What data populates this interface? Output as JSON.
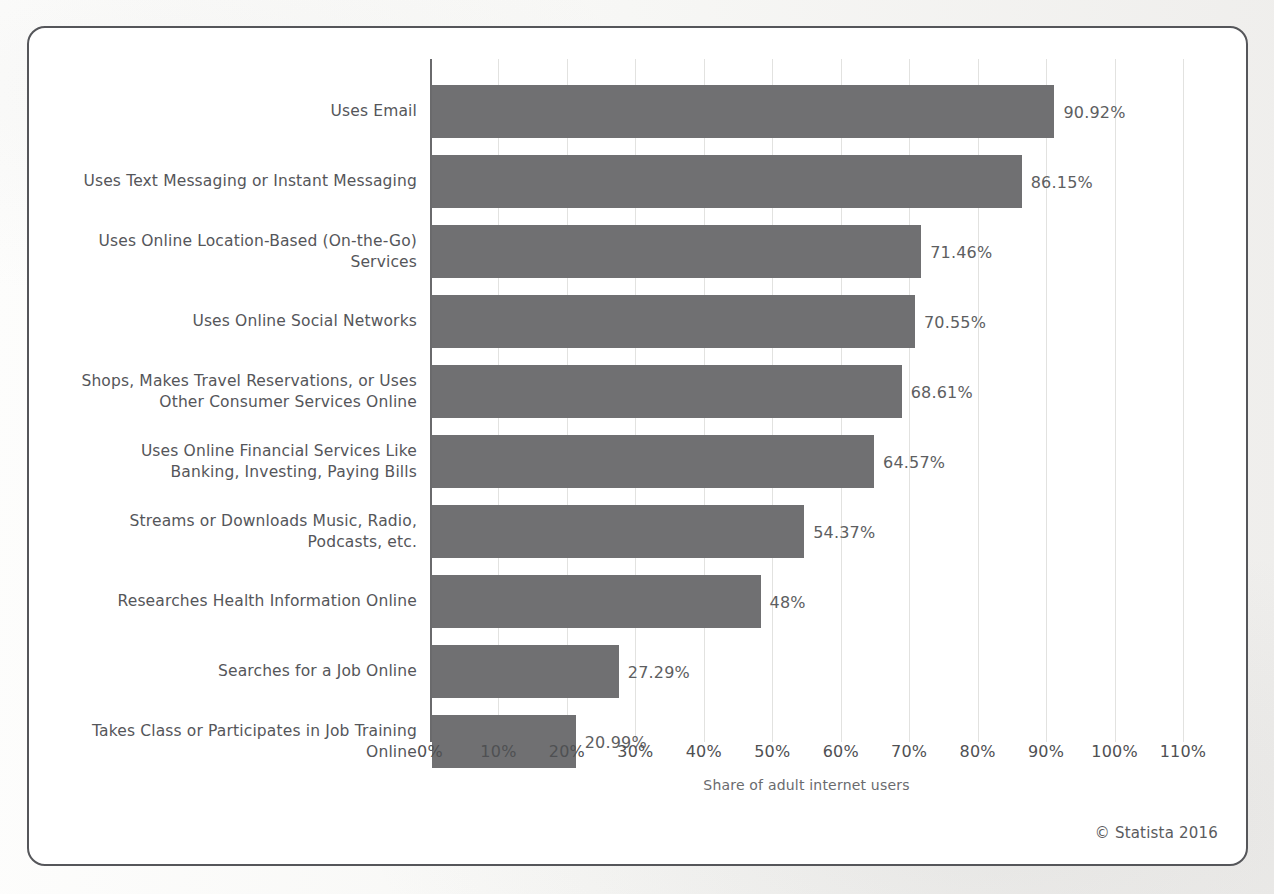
{
  "chart_data": {
    "type": "bar",
    "orientation": "horizontal",
    "title": "",
    "xlabel": "Share of adult internet users",
    "ylabel": "",
    "xlim": [
      0,
      110
    ],
    "xticks": [
      "0%",
      "10%",
      "20%",
      "30%",
      "40%",
      "50%",
      "60%",
      "70%",
      "80%",
      "90%",
      "100%",
      "110%"
    ],
    "xtick_values": [
      0,
      10,
      20,
      30,
      40,
      50,
      60,
      70,
      80,
      90,
      100,
      110
    ],
    "grid": true,
    "legend": "none",
    "bar_color": "#707072",
    "categories": [
      "Uses Email",
      "Uses Text Messaging or Instant Messaging",
      "Uses Online Location-Based (On-the-Go) Services",
      "Uses Online Social Networks",
      "Shops, Makes Travel Reservations, or Uses Other Consumer Services Online",
      "Uses Online Financial Services Like Banking, Investing, Paying Bills",
      "Streams or Downloads Music, Radio, Podcasts, etc.",
      "Researches Health Information Online",
      "Searches for a Job Online",
      "Takes Class or Participates in Job Training Online"
    ],
    "category_lines": [
      [
        "Uses Email"
      ],
      [
        "Uses Text Messaging or Instant Messaging"
      ],
      [
        "Uses Online Location-Based (On-the-Go)",
        "Services"
      ],
      [
        "Uses Online Social Networks"
      ],
      [
        "Shops, Makes Travel Reservations, or Uses",
        "Other Consumer Services Online"
      ],
      [
        "Uses Online Financial Services Like",
        "Banking, Investing, Paying Bills"
      ],
      [
        "Streams or Downloads Music, Radio,",
        "Podcasts, etc."
      ],
      [
        "Researches Health Information Online"
      ],
      [
        "Searches for a Job Online"
      ],
      [
        "Takes Class or Participates in Job Training",
        "Online"
      ]
    ],
    "values": [
      90.92,
      86.15,
      71.46,
      70.55,
      68.61,
      64.57,
      54.37,
      48,
      27.29,
      20.99
    ],
    "value_labels": [
      "90.92%",
      "86.15%",
      "71.46%",
      "70.55%",
      "68.61%",
      "64.57%",
      "54.37%",
      "48%",
      "27.29%",
      "20.99%"
    ]
  },
  "footer": {
    "copyright": "© Statista 2016"
  }
}
